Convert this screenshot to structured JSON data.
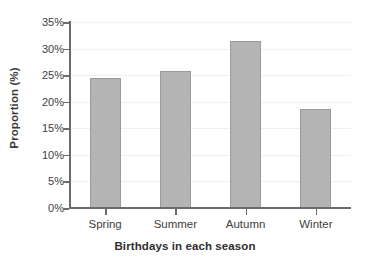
{
  "chart_data": {
    "type": "bar",
    "title": "",
    "xlabel": "Birthdays in each season",
    "ylabel": "Proportion (%)",
    "categories": [
      "Spring",
      "Summer",
      "Autumn",
      "Winter"
    ],
    "values": [
      24.4,
      25.7,
      31.4,
      18.6
    ],
    "ylim": [
      0,
      35
    ],
    "ytick_values": [
      0,
      5,
      10,
      15,
      20,
      25,
      30,
      35
    ],
    "ytick_labels": [
      "0%",
      "5%",
      "10%",
      "15%",
      "20%",
      "25%",
      "30%",
      "35%"
    ],
    "grid": true,
    "grid_axis": "y",
    "legend": false,
    "legend_position": "none",
    "bar_color": "#b4b4b4",
    "bar_edge_color": "#9a9a9a",
    "axis_color": "#6b6b6b",
    "gridline_color": "#f0f0f0",
    "tick_label_color": "#404040",
    "axis_title_color": "#2e2e2e",
    "background_color": "#ffffff"
  }
}
